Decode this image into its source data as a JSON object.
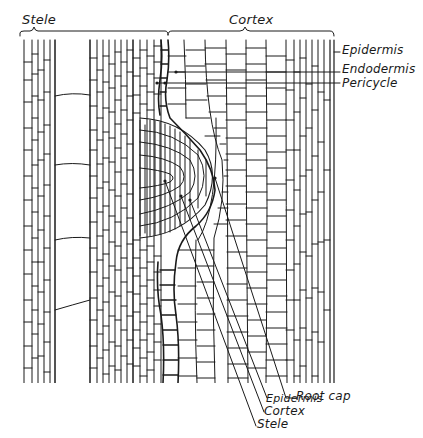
{
  "figure": {
    "type": "botanical line drawing",
    "stroke_color": "#1a1a1a",
    "background": "#ffffff"
  },
  "top_labels": {
    "stele": "Stele",
    "cortex": "Cortex"
  },
  "right_labels": {
    "epidermis": "Epidermis",
    "endodermis": "Endodermis",
    "pericycle": "Pericycle"
  },
  "bottom_labels": {
    "root_cap": "Root cap",
    "epidermis": "Epidermis",
    "cortex": "Cortex",
    "stele": "Stele"
  }
}
